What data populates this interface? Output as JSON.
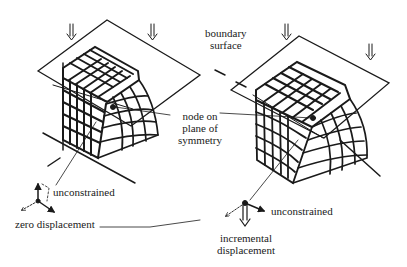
{
  "figure": {
    "type": "finite-element-mesh-diagram",
    "panels": [
      {
        "id": "left",
        "description": "undeformed block mesh under boundary surface"
      },
      {
        "id": "right",
        "description": "deformed block mesh under boundary surface"
      }
    ],
    "colors": {
      "ink": "#1a1a1a",
      "background": "#ffffff"
    }
  },
  "labels": {
    "boundary_surface_line1": "boundary",
    "boundary_surface_line2": "surface",
    "node_line1": "node on",
    "node_line2": "plane of",
    "node_line3": "symmetry",
    "unconstrained_left": "unconstrained",
    "zero_displacement": "zero displacement",
    "unconstrained_right": "unconstrained",
    "incremental_line1": "incremental",
    "incremental_line2": "displacement"
  },
  "icons": [
    "down-arrow-icon",
    "axis-triad-icon"
  ]
}
